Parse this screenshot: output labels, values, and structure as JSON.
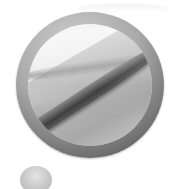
{
  "icon": {
    "name": "prohibited-sign",
    "description": "Grayscale circular no-entry style badge with diagonal slash",
    "colors": {
      "ring_light": "#cfcfcf",
      "ring_dark": "#4a4a4a",
      "inner_light": "#f8f8f8",
      "inner_dark": "#b5b5b5",
      "slash": "#3f3f3f",
      "background": "#ffffff"
    }
  },
  "secondary_shape": {
    "name": "small-gray-circle",
    "color": "#c4c4c4"
  }
}
